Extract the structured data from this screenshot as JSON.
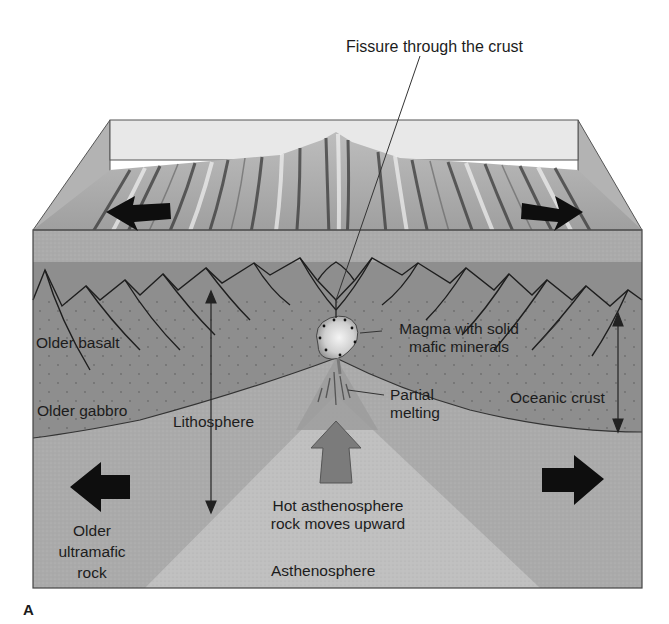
{
  "figure": {
    "panel_letter": "A",
    "type": "mid-ocean ridge cross-section block diagram",
    "colors": {
      "background": "#ffffff",
      "top_surface_back": "#e6e6e6",
      "top_surface": "#9a9a9a",
      "side_face": "#b0b0b0",
      "oceanic_crust": "#8d8d8d",
      "mantle_lithosphere": "#a9a9a9",
      "asthenosphere_plume": "#bfbfbf",
      "partial_melt_zone": "#9a9a9a",
      "upwelling_arrow": "#7a7a7a",
      "magma_chamber": "#d9d9d9",
      "spreading_arrows": "#111111",
      "outline": "#333333"
    }
  },
  "labels": {
    "fissure": "Fissure through the crust",
    "magma_line1": "Magma with solid",
    "magma_line2": "mafic minerals",
    "partial_line1": "Partial",
    "partial_line2": "melting",
    "older_basalt": "Older basalt",
    "older_gabbro": "Older gabbro",
    "lithosphere": "Lithosphere",
    "oceanic_crust": "Oceanic crust",
    "hot_line1": "Hot asthenosphere",
    "hot_line2": "rock moves upward",
    "older_ultramafic_line1": "Older",
    "older_ultramafic_line2": "ultramafic",
    "older_ultramafic_line3": "rock",
    "asthenosphere": "Asthenosphere"
  },
  "arrows": [
    {
      "name": "spreading-left-top",
      "direction": "left"
    },
    {
      "name": "spreading-right-top",
      "direction": "right"
    },
    {
      "name": "spreading-left-bottom",
      "direction": "left"
    },
    {
      "name": "spreading-right-bottom",
      "direction": "right"
    },
    {
      "name": "upwelling",
      "direction": "up"
    },
    {
      "name": "lithosphere-thickness",
      "direction": "both-vertical"
    },
    {
      "name": "oceanic-crust-thickness",
      "direction": "both-vertical"
    }
  ]
}
